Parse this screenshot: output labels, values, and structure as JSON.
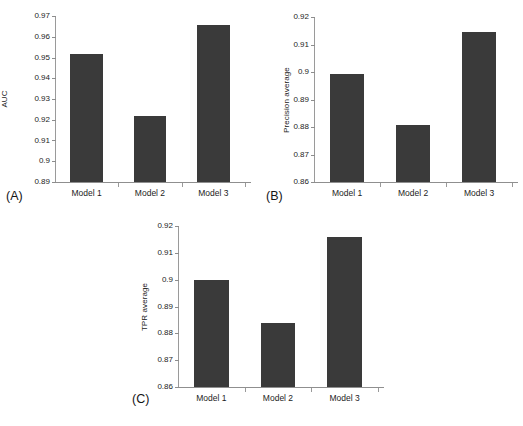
{
  "figure": {
    "background": "#ffffff",
    "bar_color": "#3a3a3a",
    "axis_color": "#9a9a9a",
    "panel_count": 3
  },
  "panels": [
    {
      "tag": "(A)",
      "ylabel": "AUC",
      "yticks": [
        "0.97",
        "0.96",
        "0.95",
        "0.94",
        "0.93",
        "0.92",
        "0.91",
        "0.9",
        "0.89"
      ],
      "ymin": 0.89,
      "ymax": 0.97,
      "categories": [
        "Model 1",
        "Model 2",
        "Model 3"
      ],
      "values": [
        0.9515,
        0.9218,
        0.9655
      ]
    },
    {
      "tag": "(B)",
      "ylabel": "Precision average",
      "yticks": [
        "0.92",
        "0.91",
        "0.9",
        "0.89",
        "0.88",
        "0.87",
        "0.86"
      ],
      "ymin": 0.86,
      "ymax": 0.92,
      "categories": [
        "Model 1",
        "Model 2",
        "Model 3"
      ],
      "values": [
        0.8993,
        0.8807,
        0.9145
      ]
    },
    {
      "tag": "(C)",
      "ylabel": "TPR average",
      "yticks": [
        "0.92",
        "0.91",
        "0.9",
        "0.89",
        "0.88",
        "0.87",
        "0.86"
      ],
      "ymin": 0.86,
      "ymax": 0.92,
      "categories": [
        "Model 1",
        "Model 2",
        "Model 3"
      ],
      "values": [
        0.8997,
        0.884,
        0.916
      ]
    }
  ],
  "chart_data": [
    {
      "type": "bar",
      "title": "",
      "panel": "(A)",
      "categories": [
        "Model 1",
        "Model 2",
        "Model 3"
      ],
      "values": [
        0.9515,
        0.9218,
        0.9655
      ],
      "xlabel": "",
      "ylabel": "AUC",
      "ylim": [
        0.89,
        0.97
      ],
      "ytick_labels": [
        "0.89",
        "0.9",
        "0.91",
        "0.92",
        "0.93",
        "0.94",
        "0.95",
        "0.96",
        "0.97"
      ],
      "grid": false,
      "legend": false
    },
    {
      "type": "bar",
      "title": "",
      "panel": "(B)",
      "categories": [
        "Model 1",
        "Model 2",
        "Model 3"
      ],
      "values": [
        0.8993,
        0.8807,
        0.9145
      ],
      "xlabel": "",
      "ylabel": "Precision average",
      "ylim": [
        0.86,
        0.92
      ],
      "ytick_labels": [
        "0.86",
        "0.87",
        "0.88",
        "0.89",
        "0.9",
        "0.91",
        "0.92"
      ],
      "grid": false,
      "legend": false
    },
    {
      "type": "bar",
      "title": "",
      "panel": "(C)",
      "categories": [
        "Model 1",
        "Model 2",
        "Model 3"
      ],
      "values": [
        0.8997,
        0.884,
        0.916
      ],
      "xlabel": "",
      "ylabel": "TPR average",
      "ylim": [
        0.86,
        0.92
      ],
      "ytick_labels": [
        "0.86",
        "0.87",
        "0.88",
        "0.89",
        "0.9",
        "0.91",
        "0.92"
      ],
      "grid": false,
      "legend": false
    }
  ]
}
